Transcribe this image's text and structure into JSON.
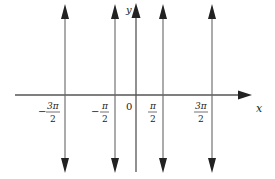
{
  "diagram": {
    "colors": {
      "line": "#555555",
      "text": "#222222",
      "background": "#ffffff"
    },
    "axes": {
      "x_label": "x",
      "y_label": "y",
      "origin_label": "0"
    },
    "asymptotes": [
      {
        "x_value": "-3π/2",
        "numerator": "3π",
        "denominator": "2",
        "sign": "−",
        "px": 65
      },
      {
        "x_value": "-π/2",
        "numerator": "π",
        "denominator": "2",
        "sign": "−",
        "px": 115
      },
      {
        "x_value": "π/2",
        "numerator": "π",
        "denominator": "2",
        "sign": "",
        "px": 163
      },
      {
        "x_value": "3π/2",
        "numerator": "3π",
        "denominator": "2",
        "sign": "",
        "px": 212
      }
    ]
  }
}
